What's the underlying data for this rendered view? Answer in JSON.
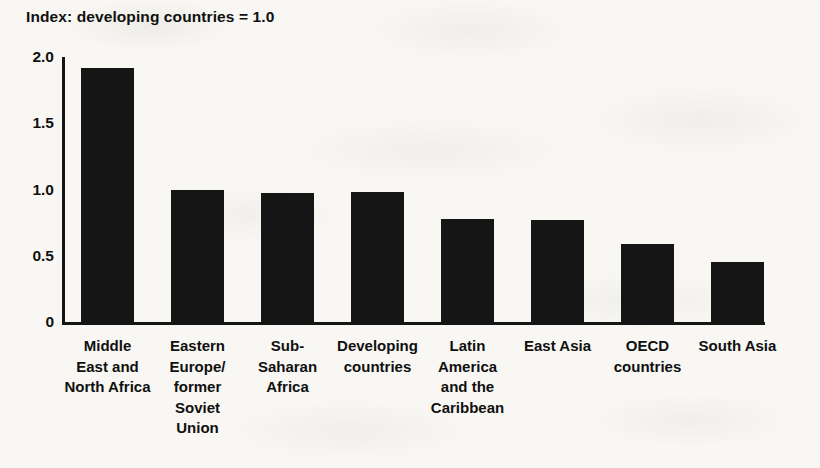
{
  "chart_data": {
    "type": "bar",
    "title": "Index: developing countries = 1.0",
    "xlabel": "",
    "ylabel": "",
    "ylim": [
      0,
      2.0
    ],
    "yticks": [
      "0",
      "0.5",
      "1.0",
      "1.5",
      "2.0"
    ],
    "ytick_values": [
      0,
      0.5,
      1.0,
      1.5,
      2.0
    ],
    "grid": false,
    "legend": "none",
    "bar_color": "#151515",
    "background_color": "#f8f7f3",
    "categories": [
      "Middle\nEast and\nNorth Africa",
      "Eastern\nEurope/\nformer\nSoviet\nUnion",
      "Sub-\nSaharan\nAfrica",
      "Developing\ncountries",
      "Latin\nAmerica\nand the\nCaribbean",
      "East Asia",
      "OECD\ncountries",
      "South Asia"
    ],
    "values": [
      1.92,
      1.0,
      0.97,
      0.98,
      0.78,
      0.77,
      0.59,
      0.45
    ]
  }
}
